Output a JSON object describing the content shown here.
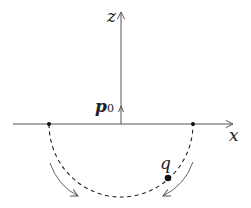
{
  "figure": {
    "axes": {
      "x_label": "x",
      "z_label": "z"
    },
    "dipole": {
      "symbol": "p",
      "subscript": "0",
      "direction": "+z"
    },
    "charge": {
      "label": "q"
    },
    "path": {
      "shape": "semicircle below x-axis",
      "style": "dashed",
      "endpoints": "two points on x-axis, symmetric about origin"
    },
    "motion_arrows": {
      "count": 2,
      "direction": "clockwise along lower path"
    },
    "colors": {
      "line": "#555555",
      "ink": "#111111",
      "background": "#ffffff"
    }
  }
}
